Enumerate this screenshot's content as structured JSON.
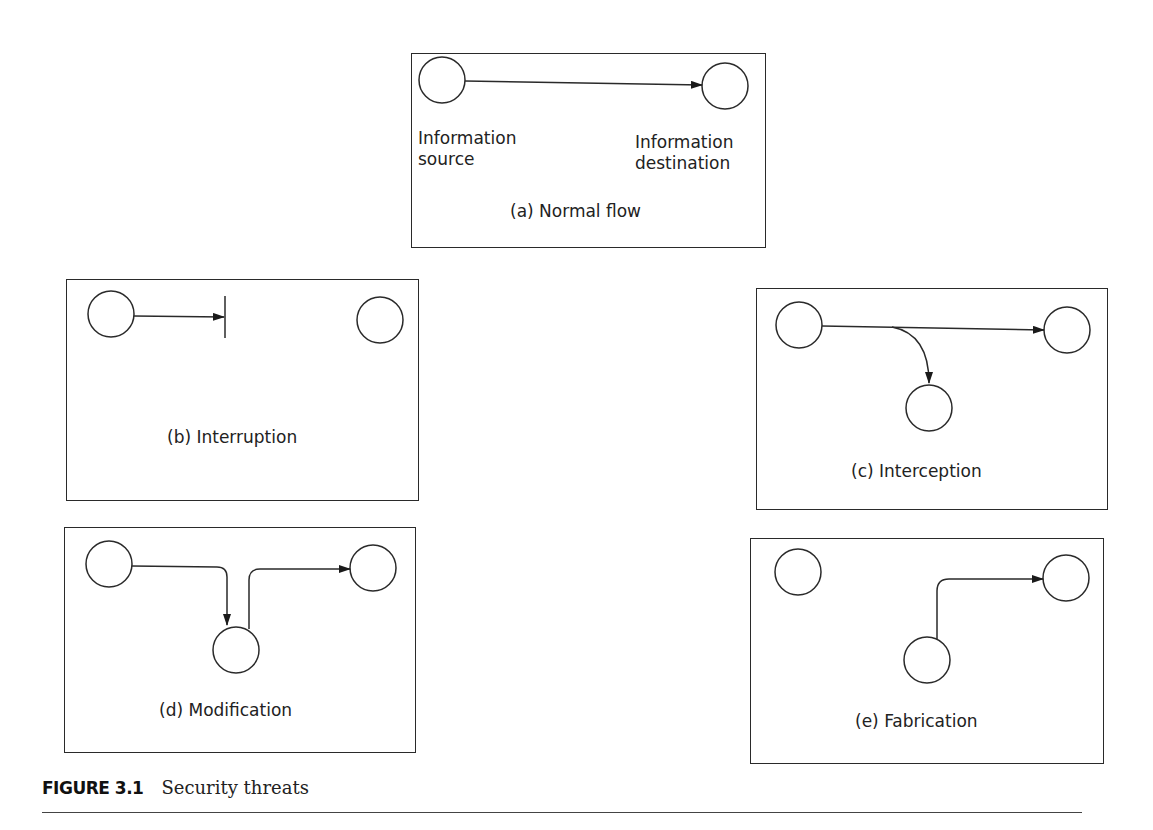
{
  "figure": {
    "number": "FIGURE 3.1",
    "title": "Security threats"
  },
  "panels": {
    "a": {
      "caption": "(a) Normal flow",
      "source_label_line1": "Information",
      "source_label_line2": "source",
      "dest_label_line1": "Information",
      "dest_label_line2": "destination"
    },
    "b": {
      "caption": "(b) Interruption"
    },
    "c": {
      "caption": "(c) Interception"
    },
    "d": {
      "caption": "(d) Modification"
    },
    "e": {
      "caption": "(e) Fabrication"
    }
  },
  "colors": {
    "stroke": "#2a2a2a",
    "background": "#ffffff"
  }
}
